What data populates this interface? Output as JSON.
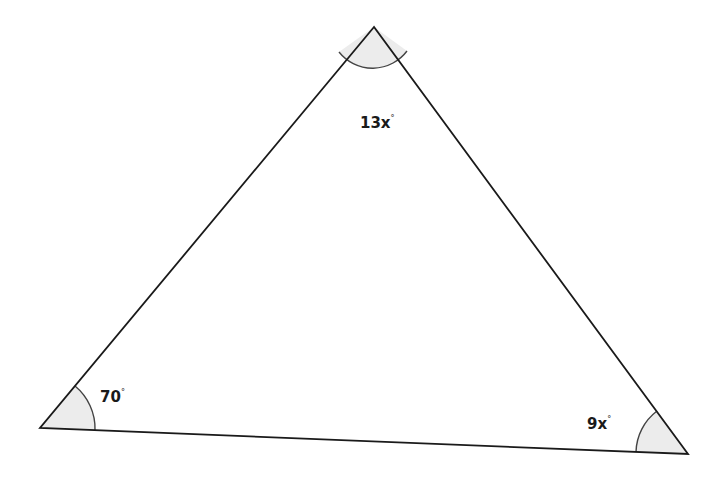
{
  "figure": {
    "type": "triangle",
    "vertices": {
      "top": {
        "x": 374,
        "y": 27
      },
      "left": {
        "x": 40,
        "y": 428
      },
      "right": {
        "x": 688,
        "y": 454
      }
    },
    "angles": {
      "top": {
        "label": "13x",
        "unit": "°"
      },
      "left": {
        "label": "70",
        "unit": "°"
      },
      "right": {
        "label": "9x",
        "unit": "°"
      }
    },
    "colors": {
      "stroke": "#1a1a1a",
      "arc_fill": "#ececec",
      "background": "#ffffff"
    }
  }
}
